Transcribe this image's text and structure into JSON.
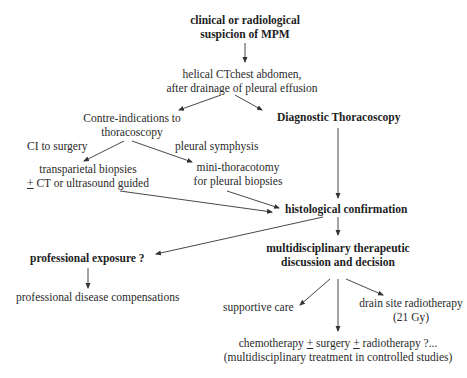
{
  "diagram": {
    "nodes": {
      "suspicion": {
        "lines": [
          "clinical or radiological",
          "suspicion of MPM"
        ],
        "bold": true
      },
      "ct": {
        "lines": [
          "helical CTchest abdomen,",
          "after drainage of pleural effusion"
        ]
      },
      "contraindications": {
        "lines": [
          "Contre-indications to",
          "thoracoscopy"
        ]
      },
      "thoracoscopy": {
        "lines": [
          "Diagnostic Thoracoscopy"
        ],
        "bold": true
      },
      "ci_surgery": {
        "label": "CI to surgery"
      },
      "pleural_symphysis": {
        "label": "pleural symphysis"
      },
      "transparietal": {
        "line1": "transparietal biopsies",
        "line2_pm": "+",
        "line2_rest": " CT or ultrasound guided"
      },
      "minithoracotomy": {
        "lines": [
          "mini-thoracotomy",
          "for pleural biopsies"
        ]
      },
      "histological": {
        "lines": [
          "histological confirmation"
        ],
        "bold": true
      },
      "professional_exposure": {
        "lines": [
          "professional exposure ?"
        ],
        "bold": true
      },
      "compensations": {
        "lines": [
          "professional disease compensations"
        ]
      },
      "multidisciplinary": {
        "lines": [
          "multidisciplinary therapeutic",
          "discussion and decision"
        ],
        "bold": true
      },
      "supportive": {
        "lines": [
          "supportive care"
        ]
      },
      "drain_site": {
        "lines": [
          "drain site radiotherapy",
          "(21 Gy)"
        ]
      },
      "chemo": {
        "line1_a": "chemotherapy ",
        "line1_pm1": "+",
        "line1_b": " surgery ",
        "line1_pm2": "+",
        "line1_c": " radiotherapy ?...",
        "line2": "(multidisciplinary treatment in controlled studies)"
      }
    },
    "edges": [
      {
        "from": "suspicion",
        "to": "ct"
      },
      {
        "from": "ct",
        "to": "contraindications"
      },
      {
        "from": "ct",
        "to": "thoracoscopy"
      },
      {
        "from": "contraindications",
        "to": "transparietal",
        "label": "CI to surgery"
      },
      {
        "from": "contraindications",
        "to": "minithoracotomy",
        "label": "pleural symphysis"
      },
      {
        "from": "transparietal",
        "to": "histological"
      },
      {
        "from": "minithoracotomy",
        "to": "histological"
      },
      {
        "from": "thoracoscopy",
        "to": "histological"
      },
      {
        "from": "histological",
        "to": "professional_exposure"
      },
      {
        "from": "histological",
        "to": "multidisciplinary"
      },
      {
        "from": "professional_exposure",
        "to": "compensations"
      },
      {
        "from": "multidisciplinary",
        "to": "supportive"
      },
      {
        "from": "multidisciplinary",
        "to": "chemo"
      },
      {
        "from": "multidisciplinary",
        "to": "drain_site"
      }
    ],
    "colors": {
      "text": "#2a2a2a",
      "arrow": "#333333",
      "background": "#ffffff"
    }
  }
}
